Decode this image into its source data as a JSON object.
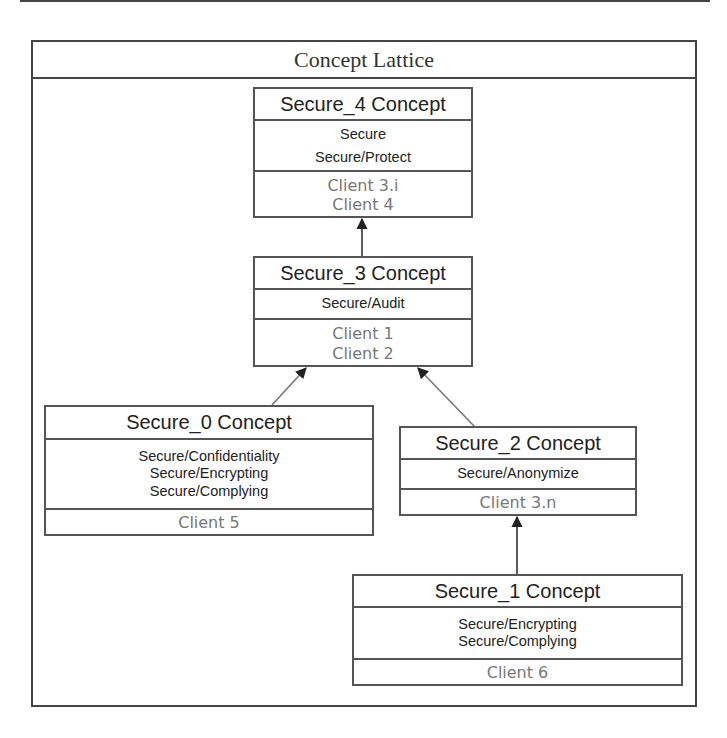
{
  "diagram": {
    "title": "Concept Lattice",
    "concepts": [
      {
        "id": "secure_4",
        "name": "Secure_4 Concept",
        "attributes": [
          "Secure",
          "Secure/Protect"
        ],
        "objects": [
          "Client 3.i",
          "Client 4"
        ]
      },
      {
        "id": "secure_3",
        "name": "Secure_3 Concept",
        "attributes": [
          "Secure/Audit"
        ],
        "objects": [
          "Client 1",
          "Client 2"
        ]
      },
      {
        "id": "secure_0",
        "name": "Secure_0 Concept",
        "attributes": [
          "Secure/Confidentiality",
          "Secure/Encrypting",
          "Secure/Complying"
        ],
        "objects": [
          "Client 5"
        ]
      },
      {
        "id": "secure_2",
        "name": "Secure_2 Concept",
        "attributes": [
          "Secure/Anonymize"
        ],
        "objects": [
          "Client 3.n"
        ]
      },
      {
        "id": "secure_1",
        "name": "Secure_1 Concept",
        "attributes": [
          "Secure/Encrypting",
          "Secure/Complying"
        ],
        "objects": [
          "Client 6"
        ]
      }
    ],
    "edges": [
      {
        "from": "Secure_3 Concept",
        "to": "Secure_4 Concept"
      },
      {
        "from": "Secure_0 Concept",
        "to": "Secure_3 Concept"
      },
      {
        "from": "Secure_2 Concept",
        "to": "Secure_3 Concept"
      },
      {
        "from": "Secure_1 Concept",
        "to": "Secure_2 Concept"
      }
    ],
    "colors": {
      "border": "#555555",
      "name_text": "#222222",
      "object_text": "#777777",
      "edge": "#666666"
    }
  }
}
